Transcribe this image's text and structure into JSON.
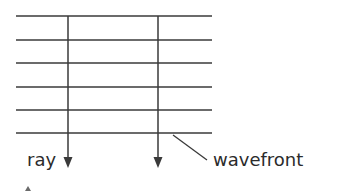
{
  "diagram": {
    "type": "plane-wave",
    "colors": {
      "line": "#6b6b6b",
      "ray": "#3a3a3a",
      "text": "#2b2b2b",
      "background": "#ffffff"
    },
    "wavefronts": {
      "x_start": 16,
      "x_end": 212,
      "y_positions": [
        16,
        40,
        63,
        87,
        110,
        133
      ]
    },
    "rays": [
      {
        "x": 68,
        "y_start": 16,
        "y_end": 168
      },
      {
        "x": 158,
        "y_start": 16,
        "y_end": 168
      }
    ],
    "labels": {
      "ray": "ray",
      "wavefront": "wavefront"
    },
    "leader_line": {
      "x1": 173,
      "y1": 135,
      "x2": 207,
      "y2": 160
    }
  }
}
